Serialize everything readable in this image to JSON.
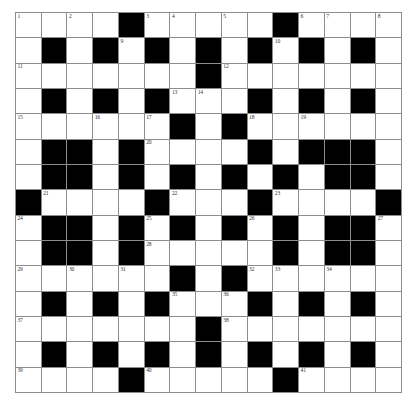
{
  "puzzle": {
    "title": "Crossword Grid",
    "type": "crossword-grid",
    "rows": 15,
    "columns": 15,
    "colors": {
      "block": "#000000",
      "cell": "#ffffff",
      "gridline": "#8d8d8d",
      "number": "#333333",
      "background": "#ffffff"
    },
    "legend": {
      "white_cell": "open letter square",
      "black_cell": "blocked square"
    },
    "grid": [
      [
        "w",
        "w",
        "w",
        "w",
        "b",
        "w",
        "w",
        "w",
        "w",
        "w",
        "b",
        "w",
        "w",
        "w",
        "w"
      ],
      [
        "w",
        "b",
        "w",
        "b",
        "w",
        "b",
        "w",
        "b",
        "w",
        "b",
        "w",
        "b",
        "w",
        "b",
        "w"
      ],
      [
        "w",
        "w",
        "w",
        "w",
        "w",
        "w",
        "w",
        "b",
        "w",
        "w",
        "w",
        "w",
        "w",
        "w",
        "w"
      ],
      [
        "w",
        "b",
        "w",
        "b",
        "w",
        "b",
        "w",
        "w",
        "w",
        "b",
        "w",
        "b",
        "w",
        "b",
        "w"
      ],
      [
        "w",
        "w",
        "w",
        "w",
        "w",
        "w",
        "b",
        "w",
        "b",
        "w",
        "w",
        "w",
        "w",
        "w",
        "w"
      ],
      [
        "w",
        "b",
        "b",
        "w",
        "b",
        "w",
        "w",
        "w",
        "w",
        "b",
        "w",
        "b",
        "b",
        "b",
        "w"
      ],
      [
        "w",
        "b",
        "b",
        "w",
        "b",
        "w",
        "b",
        "w",
        "b",
        "w",
        "b",
        "w",
        "b",
        "b",
        "w"
      ],
      [
        "b",
        "w",
        "w",
        "w",
        "w",
        "b",
        "w",
        "w",
        "w",
        "b",
        "w",
        "w",
        "w",
        "w",
        "b"
      ],
      [
        "w",
        "b",
        "b",
        "w",
        "b",
        "w",
        "b",
        "w",
        "b",
        "w",
        "b",
        "w",
        "b",
        "b",
        "w"
      ],
      [
        "w",
        "b",
        "b",
        "w",
        "b",
        "w",
        "w",
        "w",
        "w",
        "w",
        "b",
        "w",
        "b",
        "b",
        "w"
      ],
      [
        "w",
        "w",
        "w",
        "w",
        "w",
        "w",
        "b",
        "w",
        "b",
        "w",
        "w",
        "w",
        "w",
        "w",
        "w"
      ],
      [
        "w",
        "b",
        "w",
        "b",
        "w",
        "b",
        "w",
        "w",
        "w",
        "b",
        "w",
        "b",
        "w",
        "b",
        "w"
      ],
      [
        "w",
        "w",
        "w",
        "w",
        "w",
        "w",
        "w",
        "b",
        "w",
        "w",
        "w",
        "w",
        "w",
        "w",
        "w"
      ],
      [
        "w",
        "b",
        "w",
        "b",
        "w",
        "b",
        "w",
        "b",
        "w",
        "b",
        "w",
        "b",
        "w",
        "b",
        "w"
      ],
      [
        "w",
        "w",
        "w",
        "w",
        "b",
        "w",
        "w",
        "w",
        "w",
        "w",
        "b",
        "w",
        "w",
        "w",
        "w"
      ]
    ],
    "numbers": [
      {
        "row": 0,
        "col": 0,
        "label": "1"
      },
      {
        "row": 0,
        "col": 2,
        "label": "2"
      },
      {
        "row": 0,
        "col": 5,
        "label": "3"
      },
      {
        "row": 0,
        "col": 6,
        "label": "4"
      },
      {
        "row": 0,
        "col": 8,
        "label": "5"
      },
      {
        "row": 0,
        "col": 11,
        "label": "6"
      },
      {
        "row": 0,
        "col": 12,
        "label": "7"
      },
      {
        "row": 0,
        "col": 14,
        "label": "8"
      },
      {
        "row": 1,
        "col": 4,
        "label": "9"
      },
      {
        "row": 1,
        "col": 10,
        "label": "10"
      },
      {
        "row": 2,
        "col": 0,
        "label": "11"
      },
      {
        "row": 2,
        "col": 8,
        "label": "12"
      },
      {
        "row": 3,
        "col": 6,
        "label": "13"
      },
      {
        "row": 3,
        "col": 7,
        "label": "14"
      },
      {
        "row": 4,
        "col": 0,
        "label": "15"
      },
      {
        "row": 4,
        "col": 3,
        "label": "16"
      },
      {
        "row": 4,
        "col": 5,
        "label": "17"
      },
      {
        "row": 4,
        "col": 9,
        "label": "18"
      },
      {
        "row": 4,
        "col": 11,
        "label": "19"
      },
      {
        "row": 5,
        "col": 5,
        "label": "20"
      },
      {
        "row": 7,
        "col": 1,
        "label": "21"
      },
      {
        "row": 7,
        "col": 6,
        "label": "22"
      },
      {
        "row": 7,
        "col": 10,
        "label": "23"
      },
      {
        "row": 8,
        "col": 0,
        "label": "24"
      },
      {
        "row": 8,
        "col": 5,
        "label": "25"
      },
      {
        "row": 8,
        "col": 9,
        "label": "26"
      },
      {
        "row": 8,
        "col": 14,
        "label": "27"
      },
      {
        "row": 9,
        "col": 5,
        "label": "28"
      },
      {
        "row": 10,
        "col": 0,
        "label": "29"
      },
      {
        "row": 10,
        "col": 2,
        "label": "30"
      },
      {
        "row": 10,
        "col": 4,
        "label": "31"
      },
      {
        "row": 10,
        "col": 9,
        "label": "32"
      },
      {
        "row": 10,
        "col": 10,
        "label": "33"
      },
      {
        "row": 10,
        "col": 12,
        "label": "34"
      },
      {
        "row": 11,
        "col": 6,
        "label": "35"
      },
      {
        "row": 11,
        "col": 8,
        "label": "36"
      },
      {
        "row": 12,
        "col": 0,
        "label": "37"
      },
      {
        "row": 12,
        "col": 8,
        "label": "38"
      },
      {
        "row": 14,
        "col": 0,
        "label": "39"
      },
      {
        "row": 14,
        "col": 5,
        "label": "40"
      },
      {
        "row": 14,
        "col": 11,
        "label": "41"
      }
    ]
  }
}
